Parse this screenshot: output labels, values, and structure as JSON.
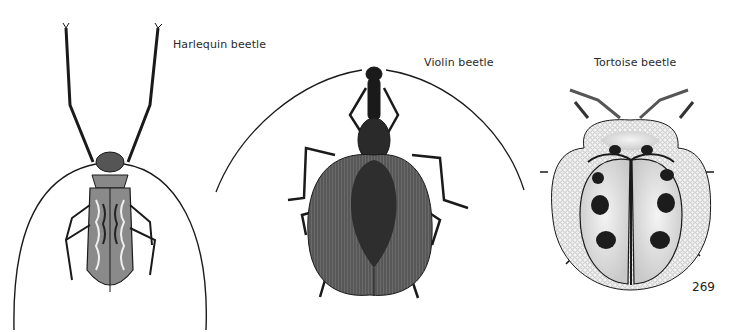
{
  "page": {
    "page_number": "269",
    "illustrations": [
      {
        "name": "harlequin-beetle",
        "caption": "Harlequin beetle"
      },
      {
        "name": "violin-beetle",
        "caption": "Violin beetle"
      },
      {
        "name": "tortoise-beetle",
        "caption": "Tortoise beetle"
      }
    ]
  },
  "colors": {
    "ink": "#1a1a1a",
    "violin_elytra": "#6e6e6e",
    "tortoise_body": "#e6e6e6",
    "tortoise_margin": "#f0f0f0",
    "tortoise_spots": "#1c1c1c"
  }
}
